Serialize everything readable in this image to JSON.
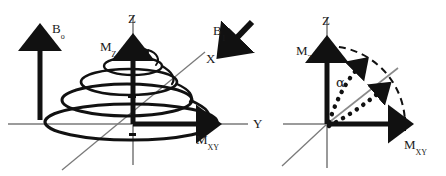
{
  "figure": {
    "background_color": "#ffffff",
    "stroke_color_dark": "#111111",
    "stroke_color_axis": "#7a7a7a",
    "width": 446,
    "height": 176
  },
  "left_panel": {
    "name": "precession-spiral-diagram",
    "labels": {
      "b0_base": "B",
      "b0_sub": "o",
      "z_axis": "Z",
      "x_axis": "X",
      "y_axis": "Y",
      "mz_base": "M",
      "mz_sub": "Z",
      "mxy_base": "M",
      "mxy_sub": "XY"
    },
    "elements": {
      "b0_arrow": "upward-bold-arrow",
      "spiral": "widening-precession-spiral",
      "spiral_turns": 5,
      "mz_vector": "vertical-bold-arrow-up",
      "mxy_vector": "horizontal-bold-arrow-right"
    }
  },
  "right_panel": {
    "name": "flip-angle-diagram",
    "labels": {
      "b1_base": "B",
      "b1_sub": "1",
      "z_axis": "Z",
      "mz_base": "M",
      "mz_sub": "Z",
      "mxy_base": "M",
      "mxy_sub": "XY",
      "alpha": "α"
    },
    "elements": {
      "b1_arrow": "diagonal-bold-arrow-down-left",
      "arc": "dashed-quarter-arc",
      "rotation_arrows": "dotted-rotation-arrows",
      "rotation_arrow_count": 2,
      "mz_vector": "vertical-bold-arrow-up",
      "mxy_vector": "horizontal-bold-arrow-right",
      "tilted_vector": "gray-diagonal-line"
    }
  }
}
